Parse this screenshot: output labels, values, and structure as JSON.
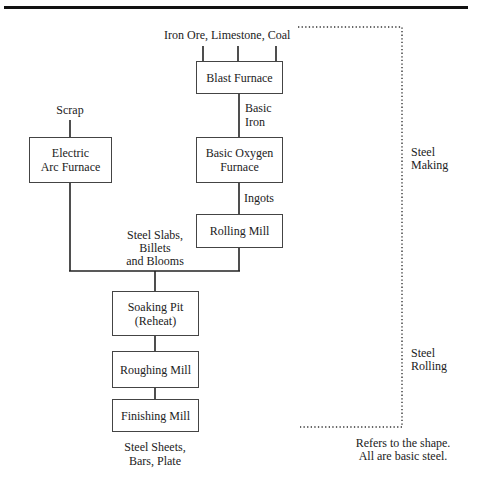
{
  "inputs": {
    "blast_furnace_inputs": "Iron Ore, Limestone, Coal",
    "scrap": "Scrap"
  },
  "boxes": {
    "blast_furnace": "Blast Furnace",
    "electric_arc_furnace": "Electric\nArc Furnace",
    "basic_oxygen_furnace": "Basic Oxygen\nFurnace",
    "rolling_mill": "Rolling Mill",
    "soaking_pit": "Soaking Pit\n(Reheat)",
    "roughing_mill": "Roughing Mill",
    "finishing_mill": "Finishing Mill"
  },
  "edge_labels": {
    "basic_iron_1": "Basic",
    "basic_iron_2": "Iron",
    "ingots": "Ingots",
    "slabs_1": "Steel Slabs,",
    "slabs_2": "Billets",
    "slabs_3": "and Blooms"
  },
  "outputs": {
    "line1": "Steel Sheets,",
    "line2": "Bars, Plate"
  },
  "stages": {
    "making_1": "Steel",
    "making_2": "Making",
    "rolling_1": "Steel",
    "rolling_2": "Rolling"
  },
  "note": {
    "line1": "Refers to the shape.",
    "line2": "All are basic steel."
  }
}
